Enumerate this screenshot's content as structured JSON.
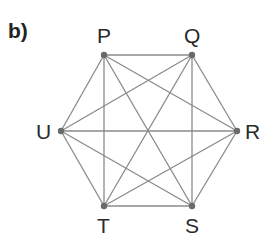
{
  "part_label": "b)",
  "graph": {
    "type": "complete-graph-K6",
    "vertices": [
      {
        "id": "P",
        "x": 104,
        "y": 55,
        "label_x": 97,
        "label_y": 43
      },
      {
        "id": "Q",
        "x": 192,
        "y": 55,
        "label_x": 184,
        "label_y": 43
      },
      {
        "id": "R",
        "x": 237,
        "y": 131,
        "label_x": 245,
        "label_y": 139
      },
      {
        "id": "S",
        "x": 192,
        "y": 206,
        "label_x": 185,
        "label_y": 233
      },
      {
        "id": "T",
        "x": 104,
        "y": 206,
        "label_x": 97,
        "label_y": 233
      },
      {
        "id": "U",
        "x": 61,
        "y": 131,
        "label_x": 36,
        "label_y": 139
      }
    ],
    "edges": [
      [
        "P",
        "Q"
      ],
      [
        "P",
        "R"
      ],
      [
        "P",
        "S"
      ],
      [
        "P",
        "T"
      ],
      [
        "P",
        "U"
      ],
      [
        "Q",
        "R"
      ],
      [
        "Q",
        "S"
      ],
      [
        "Q",
        "T"
      ],
      [
        "Q",
        "U"
      ],
      [
        "R",
        "S"
      ],
      [
        "R",
        "T"
      ],
      [
        "R",
        "U"
      ],
      [
        "S",
        "T"
      ],
      [
        "S",
        "U"
      ],
      [
        "T",
        "U"
      ]
    ],
    "colors": {
      "edge": "#8a8a8a",
      "vertex": "#6a6a6a",
      "text": "#2a2a2a"
    }
  }
}
